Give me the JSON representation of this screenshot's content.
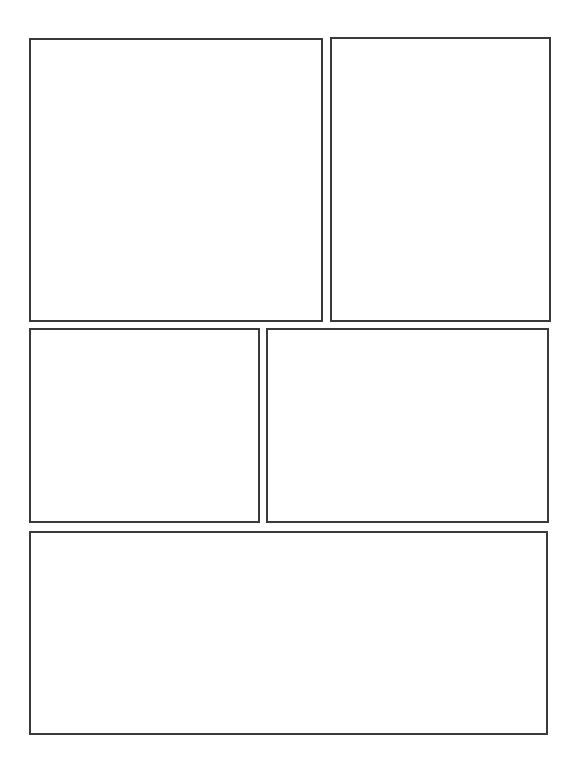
{
  "page": {
    "type": "comic-page-template",
    "background": "#ffffff",
    "border_color": "#3a3a3a"
  },
  "panels": [
    {
      "id": "panel-1",
      "row": 1,
      "x": 29,
      "y": 38,
      "w": 294,
      "h": 284
    },
    {
      "id": "panel-2",
      "row": 1,
      "x": 330,
      "y": 37,
      "w": 221,
      "h": 285
    },
    {
      "id": "panel-3",
      "row": 2,
      "x": 29,
      "y": 328,
      "w": 231,
      "h": 195
    },
    {
      "id": "panel-4",
      "row": 2,
      "x": 266,
      "y": 328,
      "w": 283,
      "h": 195
    },
    {
      "id": "panel-5",
      "row": 3,
      "x": 29,
      "y": 531,
      "w": 519,
      "h": 204
    }
  ]
}
